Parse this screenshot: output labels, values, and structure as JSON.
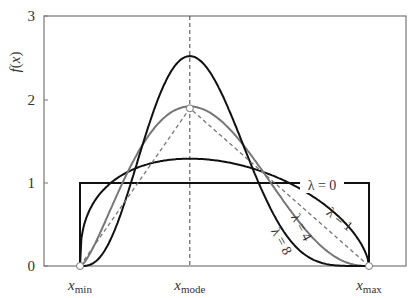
{
  "chart_data": {
    "type": "line",
    "title": "",
    "xlabel": "",
    "ylabel": "f(x)",
    "ylim": [
      0,
      3
    ],
    "yticks": [
      0,
      1,
      2,
      3
    ],
    "xticks": [
      {
        "label": "x",
        "sub": "min",
        "value": 0
      },
      {
        "label": "x",
        "sub": "mode",
        "value": 0.38
      },
      {
        "label": "x",
        "sub": "max",
        "value": 1
      }
    ],
    "xlim": [
      -0.125,
      1.125
    ],
    "mode": 0.38,
    "grid": false,
    "legend_position": "inline labels",
    "series": [
      {
        "name": "λ = 0",
        "label": "λ = 0",
        "kind": "uniform",
        "lambda": 0,
        "color": "#111111",
        "peak": 1.0
      },
      {
        "name": "λ = 1",
        "label": "λ = 1",
        "kind": "pert",
        "lambda": 1,
        "color": "#111111",
        "peak": 1.28
      },
      {
        "name": "λ = 4",
        "label": "λ = 4",
        "kind": "pert",
        "lambda": 4,
        "color": "#777777",
        "peak": 1.92
      },
      {
        "name": "λ = 8",
        "label": "λ = 8",
        "kind": "pert",
        "lambda": 8,
        "color": "#111111",
        "peak": 2.52
      },
      {
        "name": "triangular",
        "label": "",
        "kind": "triangle",
        "lambda": null,
        "color": "#777777",
        "dashed": true,
        "peak": 1.9
      }
    ],
    "annotations": [
      "vertical dashed line at x_mode",
      "open circles at x_min, x_max and triangle apex"
    ]
  }
}
